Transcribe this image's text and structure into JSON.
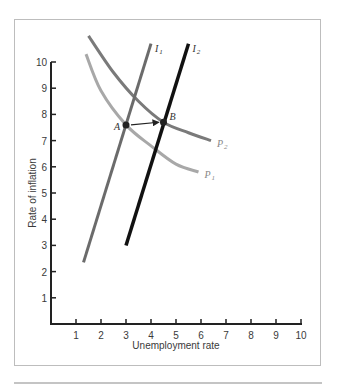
{
  "chart_data": {
    "type": "line",
    "title": "",
    "xlabel": "Unemployment rate",
    "ylabel": "Rate of inflation",
    "xlim": [
      0,
      10
    ],
    "ylim": [
      0,
      10
    ],
    "x_ticks": [
      1,
      2,
      3,
      4,
      5,
      6,
      7,
      8,
      9,
      10
    ],
    "y_ticks": [
      1,
      2,
      3,
      4,
      5,
      6,
      7,
      8,
      9,
      10
    ],
    "grid": false,
    "series": [
      {
        "name": "I1",
        "label": "I",
        "subscript": "1",
        "color": "#6b6b6b",
        "width": 3,
        "points": [
          [
            1.3,
            2.35
          ],
          [
            4.0,
            10.7
          ]
        ]
      },
      {
        "name": "I2",
        "label": "I",
        "subscript": "2",
        "color": "#111111",
        "width": 3.5,
        "points": [
          [
            3.0,
            3.0
          ],
          [
            5.5,
            10.7
          ]
        ]
      },
      {
        "name": "P1",
        "label": "P",
        "subscript": "1",
        "color": "#a8a8a8",
        "width": 3,
        "points": [
          [
            1.4,
            10.3
          ],
          [
            2.0,
            8.9
          ],
          [
            3.0,
            7.6
          ],
          [
            4.0,
            6.8
          ],
          [
            5.0,
            6.1
          ],
          [
            5.9,
            5.8
          ]
        ]
      },
      {
        "name": "P2",
        "label": "P",
        "subscript": "2",
        "color": "#7a7a7a",
        "width": 3,
        "points": [
          [
            1.5,
            11.0
          ],
          [
            2.5,
            9.6
          ],
          [
            3.5,
            8.5
          ],
          [
            4.5,
            7.7
          ],
          [
            5.5,
            7.3
          ],
          [
            6.4,
            7.0
          ]
        ]
      }
    ],
    "annotations": [
      {
        "label": "A",
        "x": 3.0,
        "y": 7.6,
        "note": "intersection of I1 and P1"
      },
      {
        "label": "B",
        "x": 4.5,
        "y": 7.7,
        "note": "intersection of I2 and P2"
      },
      {
        "type": "arrow",
        "from": [
          3.0,
          7.6
        ],
        "to": [
          4.5,
          7.7
        ]
      }
    ]
  }
}
